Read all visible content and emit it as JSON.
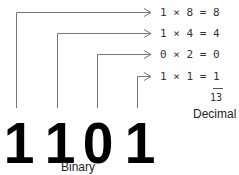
{
  "binary": {
    "digits": [
      "1",
      "1",
      "0",
      "1"
    ],
    "label": "Binary"
  },
  "equations": [
    {
      "bit": "1",
      "weight": "8",
      "result": "8",
      "text": "1 × 8 = 8"
    },
    {
      "bit": "1",
      "weight": "4",
      "result": "4",
      "text": "1 × 4 = 4"
    },
    {
      "bit": "0",
      "weight": "2",
      "result": "0",
      "text": "0 × 2 = 0"
    },
    {
      "bit": "1",
      "weight": "1",
      "result": "1",
      "text": "1 × 1 = 1"
    }
  ],
  "decimal": {
    "sum": "13",
    "label": "Decimal"
  },
  "colors": {
    "lines": "#777777",
    "digits": "#000000",
    "text": "#333333"
  }
}
